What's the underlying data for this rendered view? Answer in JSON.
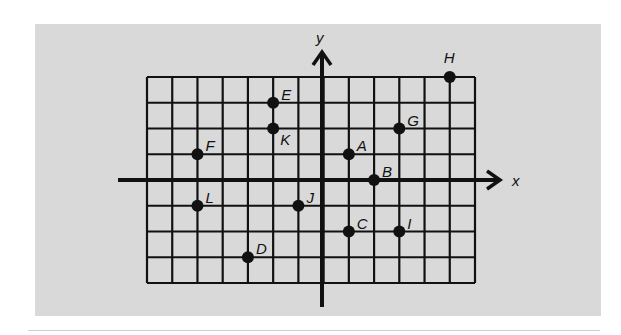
{
  "figure": {
    "panel_color": "#d9d9d9",
    "ink_color": "#111111",
    "axes": {
      "x_label": "x",
      "y_label": "y",
      "x_range": [
        -7,
        6
      ],
      "y_range": [
        -4,
        4
      ]
    },
    "grid": {
      "columns": 13,
      "rows": 8
    },
    "points": [
      {
        "label": "A",
        "x": 1,
        "y": 1
      },
      {
        "label": "B",
        "x": 2,
        "y": 0
      },
      {
        "label": "C",
        "x": 1,
        "y": -2
      },
      {
        "label": "D",
        "x": -3,
        "y": -3
      },
      {
        "label": "E",
        "x": -2,
        "y": 3
      },
      {
        "label": "F",
        "x": -5,
        "y": 1
      },
      {
        "label": "G",
        "x": 3,
        "y": 2
      },
      {
        "label": "H",
        "x": 5,
        "y": 4
      },
      {
        "label": "I",
        "x": 3,
        "y": -2
      },
      {
        "label": "J",
        "x": -1,
        "y": -1
      },
      {
        "label": "K",
        "x": -2,
        "y": 2
      },
      {
        "label": "L",
        "x": -5,
        "y": -1
      }
    ]
  }
}
